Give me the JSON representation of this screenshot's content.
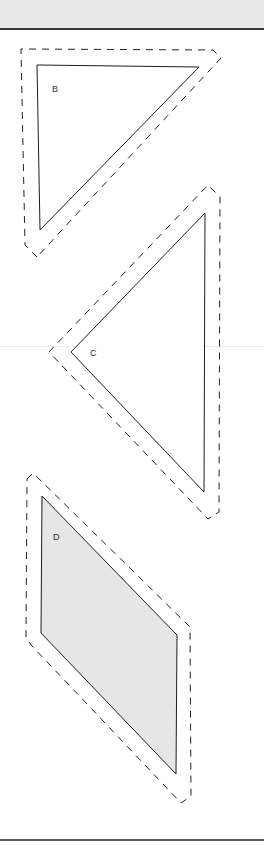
{
  "page": {
    "header_band_color": "#e9e9e9",
    "rule_color": "#3a3a3a"
  },
  "shapes": [
    {
      "id": "B",
      "label": "B",
      "kind": "right-triangle",
      "fill": "#ffffff",
      "outline": "solid",
      "cut_line": "dashed"
    },
    {
      "id": "C",
      "label": "C",
      "kind": "triangle",
      "fill": "#ffffff",
      "outline": "solid",
      "cut_line": "dashed"
    },
    {
      "id": "D",
      "label": "D",
      "kind": "parallelogram",
      "fill": "#e6e6e6",
      "outline": "solid",
      "cut_line": "dashed"
    }
  ]
}
